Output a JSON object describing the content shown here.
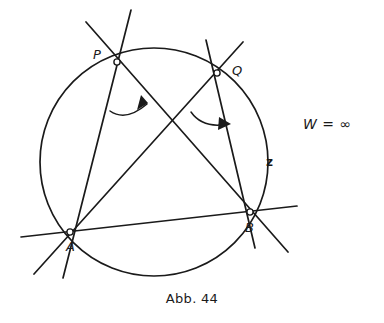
{
  "figure": {
    "caption": "Abb. 44",
    "annotation": "W = ∞",
    "arc_label": "z",
    "stroke_color": "#1a1a1a",
    "background_color": "#ffffff",
    "circle": {
      "cx": 154,
      "cy": 162,
      "r": 114
    },
    "points": [
      {
        "id": "P",
        "label": "P",
        "x": 117,
        "y": 62,
        "label_x": 93,
        "label_y": 48
      },
      {
        "id": "Q",
        "label": "Q",
        "x": 217,
        "y": 73,
        "label_x": 232,
        "label_y": 64
      },
      {
        "id": "A",
        "label": "A",
        "x": 70,
        "y": 232,
        "label_x": 66,
        "label_y": 240
      },
      {
        "id": "B",
        "label": "B",
        "x": 250,
        "y": 212,
        "label_x": 245,
        "label_y": 221
      }
    ],
    "chords": [
      {
        "name": "chord-P-B",
        "from": "P",
        "to": "B"
      },
      {
        "name": "chord-Q-A",
        "from": "Q",
        "to": "A"
      },
      {
        "name": "chord-P-A",
        "from": "P",
        "to": "A"
      },
      {
        "name": "chord-Q-B",
        "from": "Q",
        "to": "B"
      },
      {
        "name": "chord-A-B",
        "from": "A",
        "to": "B"
      }
    ],
    "angle_arcs": [
      {
        "name": "angle-arc-at-P",
        "vertex": "P"
      },
      {
        "name": "angle-arc-at-Q",
        "vertex": "Q"
      }
    ]
  }
}
